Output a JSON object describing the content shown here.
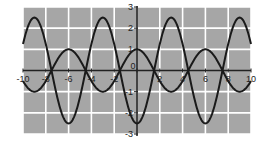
{
  "chart_data": {
    "type": "line",
    "title": "",
    "xlabel": "",
    "ylabel": "",
    "xlim": [
      -10,
      10
    ],
    "ylim": [
      -3,
      3
    ],
    "grid": true,
    "background_color": "#a6a6a6",
    "grid_color": "#ffffff",
    "line_color": "#1a1a1a",
    "x_ticks": [
      -10,
      -8,
      -6,
      -4,
      -2,
      0,
      2,
      4,
      6,
      8,
      10
    ],
    "x_tick_labels": [
      "-10",
      "-8",
      "-6",
      "-4",
      "-2",
      "0",
      "2",
      "4",
      "6",
      "8",
      "10"
    ],
    "y_ticks": [
      -3,
      -2,
      -1,
      0,
      1,
      2,
      3
    ],
    "y_tick_labels": [
      "-3",
      "-2",
      "-1",
      "0",
      "1",
      "2",
      "3"
    ],
    "series": [
      {
        "name": "y = cos(πx/3)",
        "amplitude": 1,
        "period": 6,
        "x": [
          -10,
          -9,
          -8,
          -7,
          -6,
          -5,
          -4,
          -3,
          -2,
          -1,
          0,
          1,
          2,
          3,
          4,
          5,
          6,
          7,
          8,
          9,
          10
        ],
        "values": [
          -0.5,
          -1,
          -0.5,
          0.5,
          1,
          0.5,
          -0.5,
          -1,
          -0.5,
          0.5,
          1,
          0.5,
          -0.5,
          -1,
          -0.5,
          0.5,
          1,
          0.5,
          -0.5,
          -1,
          -0.5
        ]
      },
      {
        "name": "y = -2.5cos(πx/3)",
        "amplitude": 2.5,
        "period": 6,
        "x": [
          -10,
          -9,
          -8,
          -7,
          -6,
          -5,
          -4,
          -3,
          -2,
          -1,
          0,
          1,
          2,
          3,
          4,
          5,
          6,
          7,
          8,
          9,
          10
        ],
        "values": [
          1.25,
          2.5,
          1.25,
          -1.25,
          -2.5,
          -1.25,
          1.25,
          2.5,
          1.25,
          -1.25,
          -2.5,
          -1.25,
          1.25,
          2.5,
          1.25,
          -1.25,
          -2.5,
          -1.25,
          1.25,
          2.5,
          1.25
        ]
      }
    ]
  }
}
